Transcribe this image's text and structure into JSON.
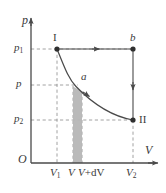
{
  "figure": {
    "kind": "pressure-volume-diagram",
    "background_color": "#ffffff",
    "line_color": "#4a4a4a",
    "dash_color": "#808080",
    "shade_color": "#b3b3b3",
    "axes": {
      "y_axis_label": "p",
      "x_axis_label": "V",
      "origin_label": "O"
    },
    "y_ticks": [
      {
        "id": "p1",
        "base": "p",
        "sub": "1",
        "y_px": 49
      },
      {
        "id": "p",
        "base": "p",
        "sub": "",
        "y_px": 85
      },
      {
        "id": "p2",
        "base": "p",
        "sub": "2",
        "y_px": 120
      }
    ],
    "x_ticks": [
      {
        "id": "V1",
        "base": "V",
        "sub": "1",
        "suffix": "",
        "x_px": 57
      },
      {
        "id": "V",
        "base": "V",
        "sub": "",
        "suffix": "",
        "x_px": 73
      },
      {
        "id": "VdV",
        "base": "V",
        "sub": "",
        "suffix": "+dV",
        "x_px": 82
      },
      {
        "id": "V2",
        "base": "V",
        "sub": "2",
        "suffix": "",
        "x_px": 133
      }
    ],
    "points": [
      {
        "id": "I",
        "label": "I",
        "roman": true,
        "x_px": 57,
        "y_px": 49,
        "label_dx": -4,
        "label_dy": -17
      },
      {
        "id": "b",
        "label": "b",
        "roman": false,
        "x_px": 133,
        "y_px": 49,
        "label_dx": -3,
        "label_dy": -17
      },
      {
        "id": "a",
        "label": "a",
        "roman": false,
        "x_px": 76,
        "y_px": 85,
        "label_dx": 5,
        "label_dy": -14
      },
      {
        "id": "II",
        "label": "II",
        "roman": true,
        "x_px": 133,
        "y_px": 120,
        "label_dx": 6,
        "label_dy": -5
      }
    ],
    "shaded_strip": {
      "x_left_px": 73,
      "x_right_px": 82,
      "top_left_y_px": 86,
      "top_right_y_px": 91,
      "bottom_y_px": 163
    },
    "arrows": [
      {
        "id": "isobaric-arrow-I-to-b",
        "direction": "right",
        "x_px": 97,
        "y_px": 49
      },
      {
        "id": "isochoric-arrow-b-to-II",
        "direction": "down",
        "x_px": 133,
        "y_px": 88
      },
      {
        "id": "isothermal-arrow-a-to-II",
        "direction": "down-right",
        "x_px": 90,
        "y_px": 96
      }
    ]
  }
}
